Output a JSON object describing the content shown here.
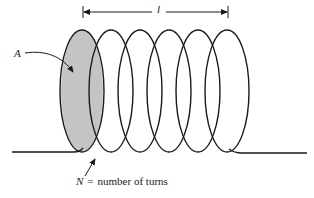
{
  "figure": {
    "type": "solenoid coil diagram",
    "colors": {
      "stroke": "#1a1a1a",
      "cross_section_fill": "#c4c4c4",
      "background": "#ffffff"
    },
    "length_label": "l",
    "area_label": "A",
    "turns_label": {
      "symbol": "N",
      "equals": "=",
      "text": "number of turns"
    },
    "coil": {
      "turn_count_drawn": 6,
      "turn_centers_x": [
        82,
        111,
        140,
        169,
        198,
        227
      ],
      "turn_center_y": 91,
      "turn_rx": 22,
      "turn_ry": 61
    }
  }
}
